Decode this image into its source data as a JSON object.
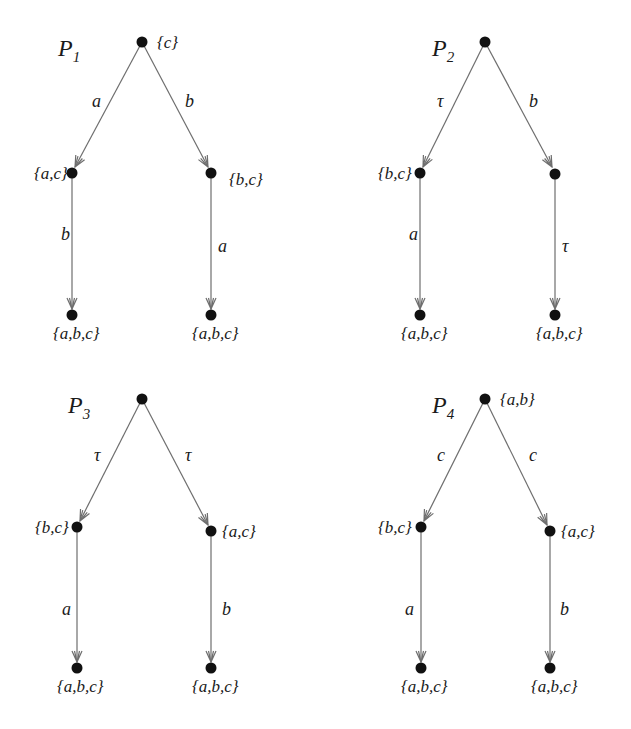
{
  "figure": {
    "colors": {
      "node": "#111111",
      "edge": "#6e6e6e",
      "text": "#1a1a1a",
      "background": "#ffffff"
    },
    "processes": [
      {
        "id": "P1",
        "name": "P",
        "subscript": "1",
        "root_label": "{c}",
        "left_edge_label": "a",
        "right_edge_label": "b",
        "left_mid_label": "{a,c}",
        "right_mid_label": "{b,c}",
        "left_lower_edge_label": "b",
        "right_lower_edge_label": "a",
        "left_leaf_label": "{a,b,c}",
        "right_leaf_label": "{a,b,c}"
      },
      {
        "id": "P2",
        "name": "P",
        "subscript": "2",
        "root_label": "",
        "left_edge_label": "τ",
        "right_edge_label": "b",
        "left_mid_label": "{b,c}",
        "right_mid_label": "",
        "left_lower_edge_label": "a",
        "right_lower_edge_label": "τ",
        "left_leaf_label": "{a,b,c}",
        "right_leaf_label": "{a,b,c}"
      },
      {
        "id": "P3",
        "name": "P",
        "subscript": "3",
        "root_label": "",
        "left_edge_label": "τ",
        "right_edge_label": "τ",
        "left_mid_label": "{b,c}",
        "right_mid_label": "{a,c}",
        "left_lower_edge_label": "a",
        "right_lower_edge_label": "b",
        "left_leaf_label": "{a,b,c}",
        "right_leaf_label": "{a,b,c}"
      },
      {
        "id": "P4",
        "name": "P",
        "subscript": "4",
        "root_label": "{a,b}",
        "left_edge_label": "c",
        "right_edge_label": "c",
        "left_mid_label": "{b,c}",
        "right_mid_label": "{a,c}",
        "left_lower_edge_label": "a",
        "right_lower_edge_label": "b",
        "left_leaf_label": "{a,b,c}",
        "right_leaf_label": "{a,b,c}"
      }
    ]
  }
}
